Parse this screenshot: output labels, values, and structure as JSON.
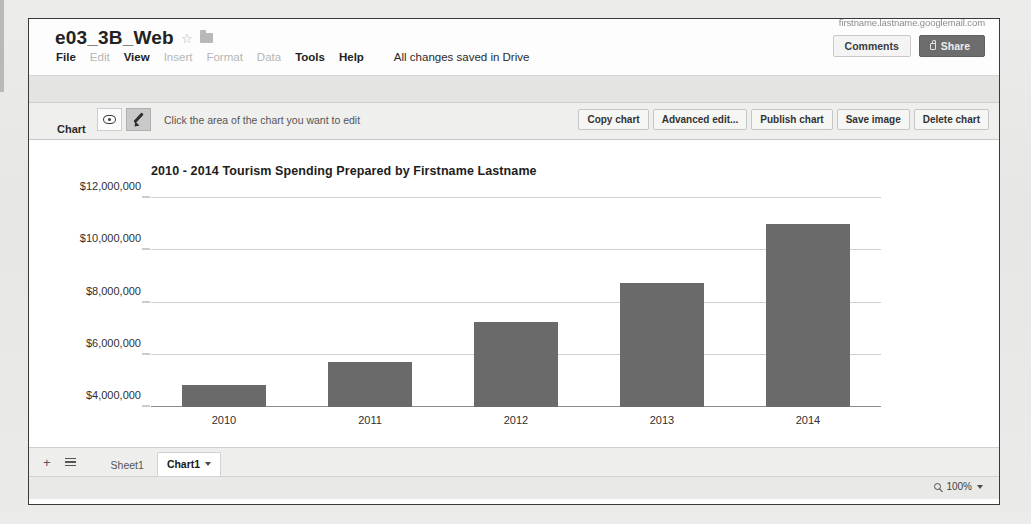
{
  "app": {
    "doc_title": "e03_3B_Web",
    "account_email": "firstname.lastname.googlemail.com",
    "save_status": "All changes saved in Drive",
    "star_icon": "star-icon",
    "folder_icon": "folder-icon"
  },
  "header": {
    "menu_items": [
      {
        "label": "File",
        "enabled": true
      },
      {
        "label": "Edit",
        "enabled": false
      },
      {
        "label": "View",
        "enabled": true
      },
      {
        "label": "Insert",
        "enabled": false
      },
      {
        "label": "Format",
        "enabled": false
      },
      {
        "label": "Data",
        "enabled": false
      },
      {
        "label": "Tools",
        "enabled": true
      },
      {
        "label": "Help",
        "enabled": true
      }
    ],
    "comments_label": "Comments",
    "share_label": "Share"
  },
  "chart_toolbar": {
    "section_label": "Chart",
    "hint": "Click the area of the chart you want to edit",
    "eye_icon": "eye-icon",
    "pencil_icon": "pencil-icon",
    "actions": [
      "Copy chart",
      "Advanced edit...",
      "Publish chart",
      "Save image",
      "Delete chart"
    ]
  },
  "sheet_bar": {
    "add_sheet_label": "+",
    "all_sheets_icon": "hamburger-icon",
    "tabs": [
      {
        "label": "Sheet1",
        "active": false,
        "has_caret": false
      },
      {
        "label": "Chart1",
        "active": true,
        "has_caret": true
      }
    ]
  },
  "status_bar": {
    "zoom_icon": "magnifier-icon",
    "zoom_level": "100%"
  },
  "chart_data": {
    "type": "bar",
    "title": "2010 - 2014 Tourism Spending Prepared by Firstname Lastname",
    "xlabel": "",
    "ylabel": "",
    "categories": [
      "2010",
      "2011",
      "2012",
      "2013",
      "2014"
    ],
    "values": [
      4850000,
      5730000,
      7270000,
      8750000,
      11000000
    ],
    "ylim": [
      4000000,
      12000000
    ],
    "yticks": [
      4000000,
      6000000,
      8000000,
      10000000,
      12000000
    ],
    "ytick_labels": [
      "$4,000,000",
      "$6,000,000",
      "$8,000,000",
      "$10,000,000",
      "$12,000,000"
    ],
    "bar_color": "#6a6a6a",
    "grid": true,
    "grid_color": "#cfcfcf",
    "legend": false,
    "legend_position": "none",
    "series": [
      {
        "name": "Tourism Spending",
        "values": [
          4850000,
          5730000,
          7270000,
          8750000,
          11000000
        ]
      }
    ]
  }
}
